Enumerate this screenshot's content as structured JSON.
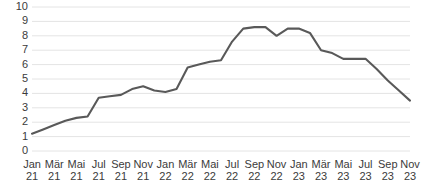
{
  "chart_data": {
    "type": "line",
    "title": "",
    "subtitle": "",
    "xlabel": "",
    "ylabel": "",
    "grid": true,
    "legend": false,
    "legend_position": "none",
    "line_color": "#595959",
    "grid_color": "#e4e4e4",
    "axis_text_color": "#3b3b3b",
    "ylim": [
      0,
      10
    ],
    "ytick_labels": [
      "10",
      "9",
      "8",
      "7",
      "6",
      "5",
      "4",
      "3",
      "2",
      "1",
      "0"
    ],
    "ytick_values": [
      10,
      9,
      8,
      7,
      6,
      5,
      4,
      3,
      2,
      1,
      0
    ],
    "xtick_labels": [
      {
        "month": "Jan",
        "year": "21"
      },
      {
        "month": "Mär",
        "year": "21"
      },
      {
        "month": "Mai",
        "year": "21"
      },
      {
        "month": "Jul",
        "year": "21"
      },
      {
        "month": "Sep",
        "year": "21"
      },
      {
        "month": "Nov",
        "year": "21"
      },
      {
        "month": "Jan",
        "year": "22"
      },
      {
        "month": "Mär",
        "year": "22"
      },
      {
        "month": "Mai",
        "year": "22"
      },
      {
        "month": "Jul",
        "year": "22"
      },
      {
        "month": "Sep",
        "year": "22"
      },
      {
        "month": "Nov",
        "year": "22"
      },
      {
        "month": "Jan",
        "year": "23"
      },
      {
        "month": "Mär",
        "year": "23"
      },
      {
        "month": "Mai",
        "year": "23"
      },
      {
        "month": "Jul",
        "year": "23"
      },
      {
        "month": "Sep",
        "year": "23"
      },
      {
        "month": "Nov",
        "year": "23"
      }
    ],
    "categories": [
      "Jan 21",
      "Feb 21",
      "Mär 21",
      "Apr 21",
      "Mai 21",
      "Jun 21",
      "Jul 21",
      "Aug 21",
      "Sep 21",
      "Okt 21",
      "Nov 21",
      "Dez 21",
      "Jan 22",
      "Feb 22",
      "Mär 22",
      "Apr 22",
      "Mai 22",
      "Jun 22",
      "Jul 22",
      "Aug 22",
      "Sep 22",
      "Okt 22",
      "Nov 22",
      "Dez 22",
      "Jan 23",
      "Feb 23",
      "Mär 23",
      "Apr 23",
      "Mai 23",
      "Jun 23",
      "Jul 23",
      "Aug 23",
      "Sep 23",
      "Okt 23",
      "Nov 23"
    ],
    "values": [
      1.2,
      1.5,
      1.8,
      2.1,
      2.3,
      2.4,
      3.7,
      3.8,
      3.9,
      4.3,
      4.5,
      4.2,
      4.1,
      4.3,
      5.8,
      6.0,
      6.2,
      6.3,
      7.6,
      8.5,
      8.6,
      8.6,
      8.0,
      8.5,
      8.5,
      8.2,
      7.0,
      6.8,
      6.4,
      6.4,
      6.4,
      5.7,
      4.9,
      4.2,
      3.5
    ]
  }
}
